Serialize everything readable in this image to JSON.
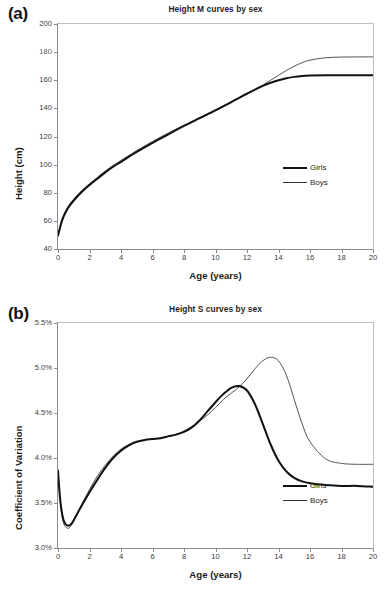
{
  "figure": {
    "panels": [
      {
        "letter": "(a)",
        "title": "Height M curves by sex",
        "xlabel": "Age (years)",
        "ylabel": "Height (cm)",
        "yticks": [
          "200",
          "180",
          "160",
          "140",
          "120",
          "100",
          "80",
          "60",
          "40"
        ],
        "xticks": [
          "0",
          "2",
          "4",
          "6",
          "8",
          "10",
          "12",
          "14",
          "16",
          "18",
          "20"
        ],
        "legend": [
          {
            "label": "Girls",
            "style": "thick"
          },
          {
            "label": "Boys",
            "style": "thin"
          }
        ]
      },
      {
        "letter": "(b)",
        "title": "Height S curves by sex",
        "xlabel": "Age (years)",
        "ylabel": "Coefficient of Variation",
        "yticks": [
          "5.5%",
          "5.0%",
          "4.5%",
          "4.0%",
          "3.5%",
          "3.0%"
        ],
        "xticks": [
          "0",
          "2",
          "4",
          "6",
          "8",
          "10",
          "12",
          "14",
          "16",
          "18",
          "20"
        ],
        "legend": [
          {
            "label": "Girls",
            "style": "thick"
          },
          {
            "label": "Boys",
            "style": "thin"
          }
        ]
      }
    ]
  },
  "chart_data": [
    {
      "type": "line",
      "title": "Height M curves by sex",
      "xlabel": "Age (years)",
      "ylabel": "Height (cm)",
      "xlim": [
        0,
        20
      ],
      "ylim": [
        40,
        200
      ],
      "xticks": [
        0,
        2,
        4,
        6,
        8,
        10,
        12,
        14,
        16,
        18,
        20
      ],
      "yticks": [
        40,
        60,
        80,
        100,
        120,
        140,
        160,
        180,
        200
      ],
      "grid": false,
      "legend_position": "right-middle",
      "x": [
        0,
        0.25,
        0.5,
        0.75,
        1,
        1.5,
        2,
        2.5,
        3,
        3.5,
        4,
        5,
        6,
        7,
        8,
        9,
        10,
        11,
        12,
        13,
        13.5,
        14,
        14.5,
        15,
        15.5,
        16,
        17,
        18,
        19,
        20
      ],
      "series": [
        {
          "name": "Girls",
          "style": "thick",
          "values": [
            49.5,
            60.0,
            66.5,
            71.0,
            74.5,
            80.5,
            85.5,
            90.0,
            94.5,
            98.5,
            102.0,
            109.0,
            115.5,
            121.5,
            127.5,
            133.0,
            138.5,
            144.5,
            150.5,
            156.0,
            158.2,
            160.0,
            161.4,
            162.4,
            163.0,
            163.3,
            163.5,
            163.5,
            163.5,
            163.5
          ]
        },
        {
          "name": "Boys",
          "style": "thin",
          "values": [
            50.0,
            61.0,
            67.5,
            72.0,
            75.5,
            81.5,
            86.5,
            91.0,
            95.5,
            99.5,
            103.0,
            110.0,
            116.5,
            122.5,
            128.0,
            133.5,
            139.0,
            144.5,
            150.0,
            156.5,
            160.0,
            163.5,
            167.0,
            170.0,
            172.5,
            174.3,
            176.0,
            176.5,
            176.6,
            176.6
          ]
        }
      ]
    },
    {
      "type": "line",
      "title": "Height S curves by sex",
      "xlabel": "Age (years)",
      "ylabel": "Coefficient of Variation",
      "xlim": [
        0,
        20
      ],
      "ylim": [
        3.0,
        5.5
      ],
      "xticks": [
        0,
        2,
        4,
        6,
        8,
        10,
        12,
        14,
        16,
        18,
        20
      ],
      "yticks": [
        3.0,
        3.5,
        4.0,
        4.5,
        5.0,
        5.5
      ],
      "unit": "%",
      "grid": false,
      "legend_position": "right-lower",
      "x": [
        0,
        0.15,
        0.35,
        0.6,
        0.8,
        1,
        1.5,
        2,
        2.5,
        3,
        3.5,
        4,
        4.5,
        5,
        5.5,
        6,
        6.5,
        7,
        7.5,
        8,
        8.5,
        9,
        9.5,
        10,
        10.5,
        11,
        11.5,
        12,
        12.5,
        13,
        13.5,
        14,
        14.5,
        15,
        15.5,
        16,
        17,
        18,
        19,
        20
      ],
      "series": [
        {
          "name": "Girls",
          "style": "thick",
          "values": [
            3.86,
            3.52,
            3.31,
            3.25,
            3.26,
            3.31,
            3.47,
            3.62,
            3.76,
            3.89,
            4.0,
            4.08,
            4.14,
            4.18,
            4.2,
            4.21,
            4.22,
            4.24,
            4.26,
            4.29,
            4.34,
            4.42,
            4.52,
            4.62,
            4.71,
            4.78,
            4.8,
            4.75,
            4.6,
            4.38,
            4.15,
            3.97,
            3.85,
            3.78,
            3.74,
            3.72,
            3.7,
            3.69,
            3.69,
            3.68
          ]
        },
        {
          "name": "Boys",
          "style": "thin",
          "values": [
            3.85,
            3.5,
            3.28,
            3.22,
            3.24,
            3.3,
            3.48,
            3.65,
            3.8,
            3.92,
            4.02,
            4.1,
            4.15,
            4.18,
            4.2,
            4.21,
            4.22,
            4.24,
            4.26,
            4.3,
            4.35,
            4.41,
            4.48,
            4.56,
            4.65,
            4.72,
            4.79,
            4.88,
            4.99,
            5.08,
            5.12,
            5.08,
            4.92,
            4.65,
            4.38,
            4.18,
            3.99,
            3.94,
            3.93,
            3.93
          ]
        }
      ]
    }
  ]
}
